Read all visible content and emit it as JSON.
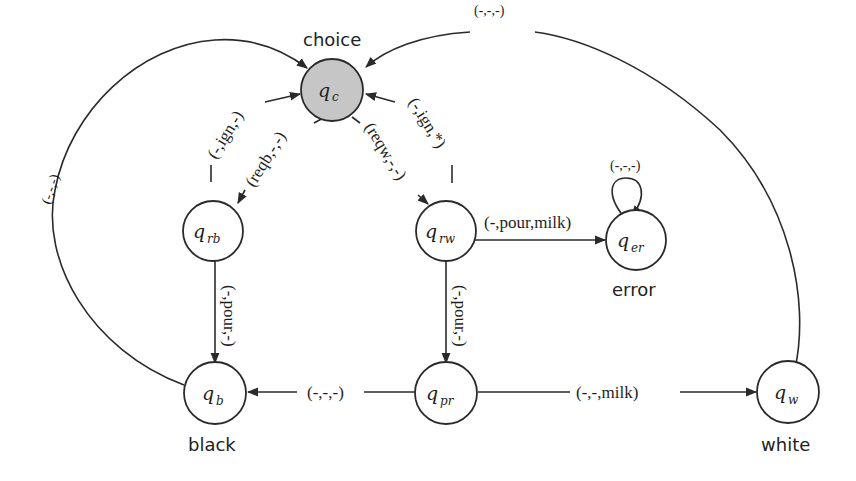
{
  "diagram": {
    "states": [
      {
        "id": "qc",
        "base": "q",
        "sub": "c",
        "name": "choice",
        "initial": true
      },
      {
        "id": "qrb",
        "base": "q",
        "sub": "rb",
        "name": ""
      },
      {
        "id": "qrw",
        "base": "q",
        "sub": "rw",
        "name": ""
      },
      {
        "id": "qer",
        "base": "q",
        "sub": "er",
        "name": "error"
      },
      {
        "id": "qb",
        "base": "q",
        "sub": "b",
        "name": "black"
      },
      {
        "id": "qpr",
        "base": "q",
        "sub": "pr",
        "name": ""
      },
      {
        "id": "qw",
        "base": "q",
        "sub": "w",
        "name": "white"
      }
    ],
    "transitions": [
      {
        "from": "qrb",
        "to": "qc",
        "label": "(-,ign,-)"
      },
      {
        "from": "qc",
        "to": "qrb",
        "label": "(reqb,-,-)"
      },
      {
        "from": "qc",
        "to": "qrw",
        "label": "(reqw,-,-)"
      },
      {
        "from": "qrw",
        "to": "qc",
        "label": "(-,ign,*)"
      },
      {
        "from": "qrw",
        "to": "qer",
        "label": "(-,pour,milk)"
      },
      {
        "from": "qer",
        "to": "qer",
        "label": "(-,-,-)"
      },
      {
        "from": "qrb",
        "to": "qb",
        "label": "(-,pour,-)"
      },
      {
        "from": "qrw",
        "to": "qpr",
        "label": "(-,pour,-)"
      },
      {
        "from": "qpr",
        "to": "qb",
        "label": "(-,-,-)"
      },
      {
        "from": "qpr",
        "to": "qw",
        "label": "(-,-,milk)"
      },
      {
        "from": "qb",
        "to": "qc",
        "label": "(-,-,-)"
      },
      {
        "from": "qw",
        "to": "qc",
        "label": "(-,-,-)"
      }
    ]
  }
}
